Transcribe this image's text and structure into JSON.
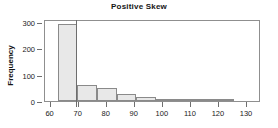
{
  "chart_data": {
    "type": "bar",
    "title": "Positive Skew",
    "xlabel": "",
    "ylabel": "Frequency",
    "xlim": [
      58,
      135
    ],
    "ylim": [
      0,
      310
    ],
    "grid": false,
    "legend": null,
    "bin_width": 7,
    "bin_edges": [
      62.5,
      69.5,
      76.5,
      83.5,
      90.5,
      97.5,
      104.5,
      111.5,
      118.5,
      125.5
    ],
    "categories": [
      "62.5-69.5",
      "69.5-76.5",
      "76.5-83.5",
      "83.5-90.5",
      "90.5-97.5",
      "97.5-104.5",
      "104.5-111.5",
      "111.5-118.5",
      "118.5-125.5"
    ],
    "values": [
      290,
      60,
      49,
      25,
      14,
      7,
      6,
      3,
      3
    ],
    "xticks": [
      60,
      70,
      80,
      90,
      100,
      110,
      120,
      130
    ],
    "xtick_labels": [
      "60",
      "70",
      "80",
      "90",
      "100",
      "110",
      "120",
      "130"
    ],
    "yticks": [
      0,
      100,
      200,
      300
    ],
    "ytick_labels": [
      "0",
      "100",
      "200",
      "300"
    ],
    "annotations": [
      {
        "name": "vertical-reference-line",
        "type": "vline",
        "x": 69.2
      }
    ],
    "colors": {
      "bar_fill": "#e8e8e8",
      "bar_stroke": "#8a8a8a",
      "axis": "#8f8f8f",
      "text": "#1a1a1a",
      "reference_line": "#6d6d6d",
      "background": "#ffffff"
    }
  }
}
